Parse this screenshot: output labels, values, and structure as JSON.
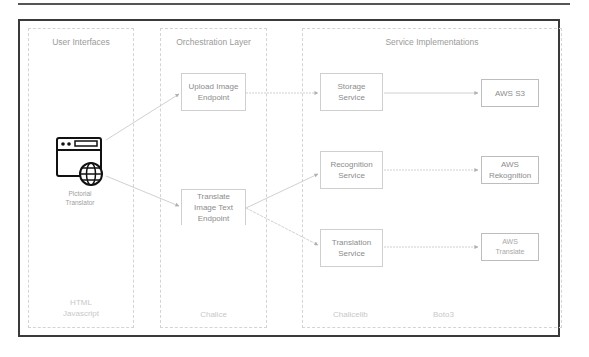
{
  "panels": {
    "user_interfaces": {
      "title": "User Interfaces",
      "client": {
        "icon": "browser-globe-icon",
        "line1": "Pictorial",
        "line2": "Translator"
      },
      "footer": {
        "line1": "HTML",
        "line2": "Javascript"
      }
    },
    "orchestration": {
      "title": "Orchestration Layer",
      "endpoints": [
        {
          "line1": "Upload Image",
          "line2": "Endpoint"
        },
        {
          "line1": "Translate",
          "line2": "Image Text",
          "line3": "Endpoint"
        }
      ],
      "footer": "Chalice"
    },
    "services": {
      "title": "Service Implementations",
      "services": [
        {
          "line1": "Storage",
          "line2": "Service"
        },
        {
          "line1": "Recognition",
          "line2": "Service"
        },
        {
          "line1": "Translation",
          "line2": "Service"
        }
      ],
      "aws": [
        {
          "line1": "AWS S3"
        },
        {
          "line1": "AWS",
          "line2": "Rekognition"
        },
        {
          "line1": "AWS",
          "line2": "Translate"
        }
      ],
      "footer_left": "Chalicelib",
      "footer_right": "Boto3"
    }
  },
  "colors": {
    "frame": "#3a3a3a",
    "panel_border": "#d4d4d4",
    "arrow": "#c4c4c4",
    "text": "#8c8c8c"
  }
}
